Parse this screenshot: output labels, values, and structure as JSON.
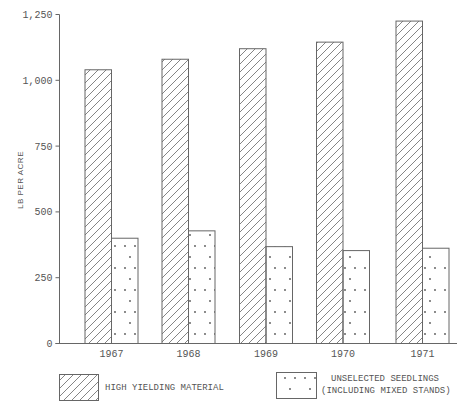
{
  "chart_data": {
    "type": "bar",
    "title": "",
    "xlabel": "",
    "ylabel": "LB PER ACRE",
    "ylim": [
      0,
      1250
    ],
    "yticks": [
      0,
      250,
      500,
      750,
      1000,
      1250
    ],
    "ytick_labels": [
      "0",
      "250",
      "500",
      "750",
      "1,000",
      "1,250"
    ],
    "categories": [
      "1967",
      "1968",
      "1969",
      "1970",
      "1971"
    ],
    "series": [
      {
        "name": "HIGH YIELDING MATERIAL",
        "pattern": "hatch",
        "values": [
          1040,
          1080,
          1120,
          1145,
          1225
        ]
      },
      {
        "name": "UNSELECTED SEEDLINGS (INCLUDING MIXED STANDS)",
        "pattern": "dots",
        "values": [
          400,
          428,
          368,
          353,
          362
        ]
      }
    ],
    "grid": false,
    "legend_position": "bottom"
  },
  "legend": {
    "items": [
      {
        "lines": [
          "HIGH YIELDING MATERIAL"
        ]
      },
      {
        "lines": [
          "UNSELECTED SEEDLINGS",
          "(INCLUDING MIXED STANDS)"
        ]
      }
    ]
  },
  "colors": {
    "ink": "#666666",
    "text": "#555555",
    "background": "#ffffff"
  }
}
